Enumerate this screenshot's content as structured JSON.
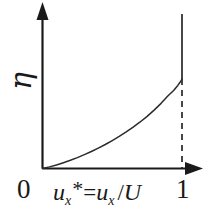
{
  "figure": {
    "name": "velocity-profile-plot",
    "background_color": "#ffffff",
    "ink_color": "#1a1a1a"
  },
  "axes": {
    "x_axis": {
      "name": "x-axis",
      "label_parts": {
        "var": "u",
        "var_sub": "x",
        "star": "*",
        "equals": "=",
        "num": "u",
        "num_sub": "x",
        "slash": "/",
        "denom": "U"
      },
      "label_text": "u_x* = u_x / U",
      "ticks": [
        "0",
        "1"
      ],
      "has_arrow": true,
      "range": [
        0,
        1
      ]
    },
    "y_axis": {
      "name": "y-axis",
      "label_text": "η",
      "label_rotated": true,
      "has_arrow": true,
      "ticks": []
    }
  },
  "markers": {
    "vertical_solid_line_at_one": true,
    "vertical_dashed_line_at_one": true
  },
  "chart_data": {
    "type": "line",
    "title": "",
    "xlabel": "u_x* = u_x / U",
    "ylabel": "η",
    "xlim": [
      0,
      1
    ],
    "ylim": [
      0,
      1
    ],
    "grid": false,
    "legend": "none",
    "x": [
      0.0,
      0.05,
      0.1,
      0.15,
      0.2,
      0.25,
      0.3,
      0.35,
      0.4,
      0.45,
      0.5,
      0.55,
      0.6,
      0.65,
      0.7,
      0.75,
      0.8,
      0.85,
      0.9,
      0.94,
      0.97,
      0.99,
      1.0
    ],
    "series": [
      {
        "name": "eta vs u_x*",
        "values": [
          0.0,
          0.018,
          0.04,
          0.065,
          0.092,
          0.122,
          0.155,
          0.19,
          0.228,
          0.268,
          0.312,
          0.358,
          0.408,
          0.462,
          0.52,
          0.583,
          0.652,
          0.728,
          0.812,
          0.872,
          0.928,
          0.972,
          1.0
        ]
      }
    ],
    "annotations": [
      {
        "text": "0",
        "position": "x-axis-origin-tick"
      },
      {
        "text": "1",
        "position": "x-axis-right-tick"
      },
      {
        "text": "η",
        "position": "y-axis-label"
      }
    ]
  }
}
